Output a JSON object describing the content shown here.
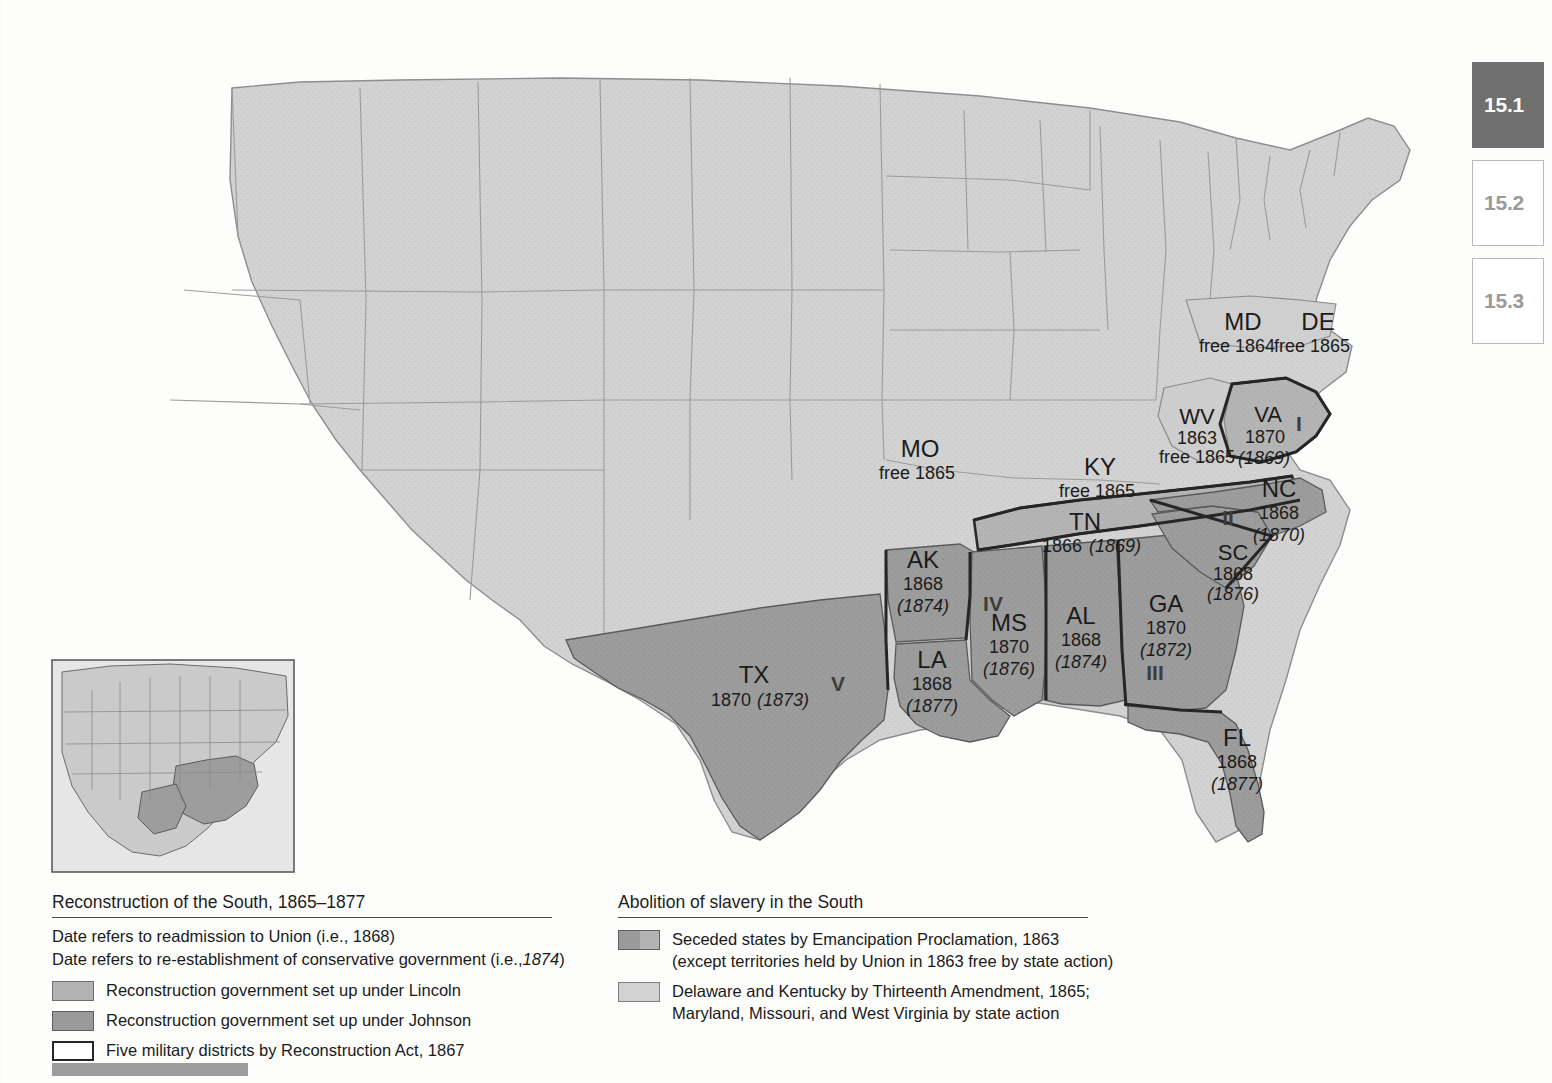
{
  "figure": {
    "number": "15.1",
    "inset_label": "locator-map-north-america"
  },
  "section_tabs": [
    {
      "label": "15.1",
      "active": true
    },
    {
      "label": "15.2",
      "active": false
    },
    {
      "label": "15.3",
      "active": false
    }
  ],
  "map": {
    "states": [
      {
        "code": "MD",
        "line1": "free 1864",
        "line2": "",
        "district": "",
        "x": 1243,
        "y": 324,
        "group": "thirteenth"
      },
      {
        "code": "DE",
        "line1": "free 1865",
        "line2": "",
        "district": "",
        "x": 1318,
        "y": 324,
        "group": "thirteenth"
      },
      {
        "code": "WV",
        "line1": "1863",
        "line2": "free 1865",
        "district": "",
        "x": 1197,
        "y": 417,
        "group": "thirteenth"
      },
      {
        "code": "VA",
        "line1": "1870",
        "line2": "(1869)",
        "district": "I",
        "x": 1268,
        "y": 417,
        "group": "johnson"
      },
      {
        "code": "MO",
        "line1": "free 1865",
        "line2": "",
        "district": "",
        "x": 920,
        "y": 450,
        "group": "thirteenth"
      },
      {
        "code": "KY",
        "line1": "free 1865",
        "line2": "",
        "district": "",
        "x": 1100,
        "y": 468,
        "group": "thirteenth"
      },
      {
        "code": "TN",
        "line1": "1866 (1869)",
        "line2": "",
        "district": "",
        "x": 1085,
        "y": 523,
        "group": "lincoln"
      },
      {
        "code": "NC",
        "line1": "1868",
        "line2": "(1870)",
        "district": "II",
        "x": 1275,
        "y": 490,
        "group": "johnson"
      },
      {
        "code": "SC",
        "line1": "1868",
        "line2": "(1876)",
        "district": "",
        "x": 1233,
        "y": 553,
        "group": "johnson"
      },
      {
        "code": "AK",
        "line1": "1868",
        "line2": "(1874)",
        "district": "",
        "x": 923,
        "y": 561,
        "group": "johnson"
      },
      {
        "code": "GA",
        "line1": "1870",
        "line2": "(1872)",
        "district": "III",
        "x": 1166,
        "y": 604,
        "group": "johnson"
      },
      {
        "code": "MS",
        "line1": "1870",
        "line2": "(1876)",
        "district": "IV",
        "x": 1006,
        "y": 624,
        "group": "johnson"
      },
      {
        "code": "AL",
        "line1": "1868",
        "line2": "(1874)",
        "district": "",
        "x": 1081,
        "y": 617,
        "group": "johnson"
      },
      {
        "code": "TX",
        "line1": "1870 (1873)",
        "line2": "",
        "district": "V",
        "x": 754,
        "y": 676,
        "group": "johnson"
      },
      {
        "code": "LA",
        "line1": "1868",
        "line2": "(1877)",
        "district": "",
        "x": 930,
        "y": 661,
        "group": "johnson"
      },
      {
        "code": "FL",
        "line1": "1868",
        "line2": "(1877)",
        "district": "",
        "x": 1237,
        "y": 739,
        "group": "johnson"
      }
    ],
    "district_markers": [
      {
        "numeral": "I",
        "x": 1299,
        "y": 424
      },
      {
        "numeral": "II",
        "x": 1228,
        "y": 518
      },
      {
        "numeral": "III",
        "x": 1155,
        "y": 673
      },
      {
        "numeral": "IV",
        "x": 993,
        "y": 604
      },
      {
        "numeral": "V",
        "x": 838,
        "y": 684
      }
    ]
  },
  "legend_left": {
    "title": "Reconstruction of the South, 1865–1877",
    "note_readmission_pre": "Date refers to readmission to Union (i.e., 1868)",
    "note_conservative_pre": "Date refers to re-establishment of conservative government (i.e.,",
    "note_conservative_italic": "1874",
    "note_conservative_post": ")",
    "items": [
      {
        "swatch": "lincoln",
        "label": "Reconstruction government set up under Lincoln"
      },
      {
        "swatch": "johnson",
        "label": "Reconstruction government set up under Johnson"
      },
      {
        "swatch": "district",
        "label": "Five military districts by Reconstruction Act, 1867"
      }
    ]
  },
  "legend_right": {
    "title": "Abolition of slavery in the South",
    "items": [
      {
        "swatch": "seceded",
        "line1": "Seceded states by Emancipation Proclamation, 1863",
        "line2": "(except territories held by Union in 1863 free by state action)"
      },
      {
        "swatch": "thirteenth",
        "line1": "Delaware and Kentucky by Thirteenth Amendment, 1865;",
        "line2": "Maryland, Missouri, and West Virginia by state action"
      }
    ]
  },
  "colors": {
    "seceded_johnson": "#9a9a9a",
    "lincoln": "#b3b3b3",
    "union_free": "#d2d2d2",
    "district_border": "#262626",
    "tab_active_bg": "#6f6f6f",
    "tab_inactive_text": "#9a9a9a",
    "bottom_bar": "#9c9c9c"
  }
}
